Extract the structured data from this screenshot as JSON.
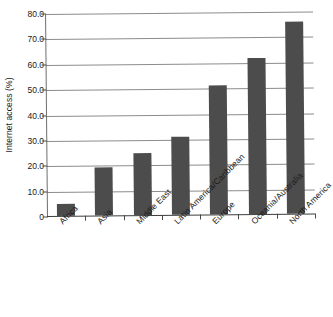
{
  "chart_data": {
    "type": "bar",
    "title": "",
    "xlabel": "",
    "ylabel": "Internet access (%)",
    "categories": [
      "Africa",
      "Asia",
      "Middle East",
      "Latin America/Caribbean",
      "Europe",
      "Oceania/Australia",
      "North America"
    ],
    "values": [
      4.7,
      19.0,
      24.6,
      30.9,
      50.9,
      61.3,
      75.6
    ],
    "ylim": [
      0,
      80
    ],
    "yticks": [
      0,
      10,
      20,
      30,
      40,
      50,
      60,
      70,
      80
    ],
    "ytick_labels": [
      "0",
      "10.0",
      "20.0",
      "30.0",
      "40.0",
      "50.0",
      "60.0",
      "70.0",
      "80.0"
    ],
    "grid": true,
    "legend": "none",
    "bar_color": "#4c4c4c",
    "gridline_color": "#8c8c8c",
    "axis_color": "#3d3d3d"
  }
}
